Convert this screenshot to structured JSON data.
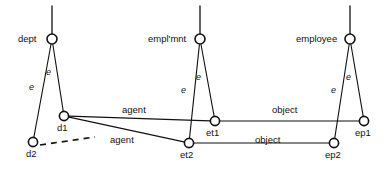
{
  "diagram": {
    "background_color": "#ffffff",
    "stroke_color": "#111111",
    "width": 390,
    "height": 174,
    "nodes": [
      {
        "id": "dept",
        "label": "dept",
        "x": 52,
        "y": 39,
        "r": 5.0,
        "label_x": 18,
        "label_y": 34
      },
      {
        "id": "emplmnt",
        "label": "empl'mnt",
        "x": 200,
        "y": 39,
        "r": 5.0,
        "label_x": 148,
        "label_y": 34
      },
      {
        "id": "employee",
        "label": "employee",
        "x": 350,
        "y": 39,
        "r": 5.0,
        "label_x": 296,
        "label_y": 34
      },
      {
        "id": "d1",
        "label": "d1",
        "x": 64,
        "y": 116,
        "r": 4.6,
        "label_x": 57,
        "label_y": 123
      },
      {
        "id": "d2",
        "label": "d2",
        "x": 33,
        "y": 142,
        "r": 4.6,
        "label_x": 26,
        "label_y": 149
      },
      {
        "id": "et1",
        "label": "et1",
        "x": 215,
        "y": 121,
        "r": 4.6,
        "label_x": 206,
        "label_y": 128
      },
      {
        "id": "et2",
        "label": "et2",
        "x": 189,
        "y": 143,
        "r": 4.6,
        "label_x": 180,
        "label_y": 150
      },
      {
        "id": "ep1",
        "label": "ep1",
        "x": 364,
        "y": 121,
        "r": 4.6,
        "label_x": 355,
        "label_y": 128
      },
      {
        "id": "ep2",
        "label": "ep2",
        "x": 334,
        "y": 143,
        "r": 4.6,
        "label_x": 325,
        "label_y": 150
      }
    ],
    "stems": [
      {
        "id": "stem-dept",
        "x1": 52,
        "y1": 34,
        "x2": 52,
        "y2": 6
      },
      {
        "id": "stem-emplmnt",
        "x1": 200,
        "y1": 34,
        "x2": 200,
        "y2": 6
      },
      {
        "id": "stem-employee",
        "x1": 350,
        "y1": 34,
        "x2": 350,
        "y2": 6
      }
    ],
    "edges": [
      {
        "id": "dept-d1",
        "from": "dept",
        "to": "d1",
        "label": "e",
        "label_x": 46,
        "label_y": 68,
        "style": "solid",
        "italic": true
      },
      {
        "id": "dept-d2",
        "from": "dept",
        "to": "d2",
        "label": "e",
        "label_x": 29,
        "label_y": 83,
        "style": "solid",
        "italic": true
      },
      {
        "id": "emplmnt-et1",
        "from": "emplmnt",
        "to": "et1",
        "label": "e",
        "label_x": 196,
        "label_y": 73,
        "style": "solid",
        "italic": true
      },
      {
        "id": "emplmnt-et2",
        "from": "emplmnt",
        "to": "et2",
        "label": "e",
        "label_x": 181,
        "label_y": 86,
        "style": "solid",
        "italic": true
      },
      {
        "id": "employee-ep1",
        "from": "employee",
        "to": "ep1",
        "label": "e",
        "label_x": 346,
        "label_y": 73,
        "style": "solid",
        "italic": true
      },
      {
        "id": "employee-ep2",
        "from": "employee",
        "to": "ep2",
        "label": "e",
        "label_x": 331,
        "label_y": 86,
        "style": "solid",
        "italic": true
      },
      {
        "id": "d1-et1",
        "from": "d1",
        "to": "et1",
        "label": "agent",
        "label_x": 122,
        "label_y": 105,
        "style": "solid",
        "italic": false
      },
      {
        "id": "d1-et2",
        "from": "d1",
        "to": "et2",
        "label": "agent",
        "label_x": 110,
        "label_y": 135,
        "style": "solid",
        "italic": false
      },
      {
        "id": "et1-ep1",
        "from": "et1",
        "to": "ep1",
        "label": "object",
        "label_x": 272,
        "label_y": 105,
        "style": "solid",
        "italic": false
      },
      {
        "id": "et2-ep2",
        "from": "et2",
        "to": "ep2",
        "label": "object",
        "label_x": 255,
        "label_y": 135,
        "style": "solid",
        "italic": false
      }
    ],
    "dashed_edges": [
      {
        "id": "d2-continuation",
        "x1": 40,
        "y1": 145,
        "x2": 95,
        "y2": 137
      }
    ]
  }
}
